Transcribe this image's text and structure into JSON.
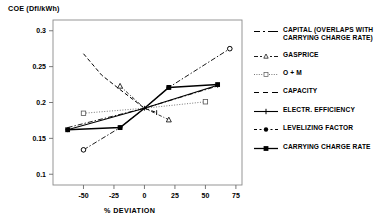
{
  "chart_data": {
    "type": "line",
    "title": "",
    "ylabel": "COE (Dfl/kWh)",
    "xlabel": "% DEVIATION",
    "xlim": [
      -75,
      80
    ],
    "ylim": [
      0.085,
      0.315
    ],
    "xticks": [
      -50,
      -25,
      0,
      25,
      50,
      75
    ],
    "xticklabels": [
      "-50",
      "-25",
      "0",
      "25",
      "50",
      "75"
    ],
    "yticks": [
      0.1,
      0.15,
      0.2,
      0.25,
      0.3
    ],
    "yticklabels": [
      "0.1",
      "0.15",
      "0.2",
      "0.25",
      "0.3"
    ],
    "grid": false,
    "legend_position": "right",
    "base_point": {
      "x": 0,
      "y": 0.192
    },
    "series": [
      {
        "name": "CAPITAL (OVERLAPS WITH CARRYING CHARGE RATE)",
        "legend_label": "CAPITAL (OVERLAPS WITH\nCARRYING CHARGE RATE)",
        "style": "dash-dot",
        "marker": "none",
        "color": "#000000",
        "x": [
          -63,
          0,
          60
        ],
        "y": [
          0.165,
          0.192,
          0.223
        ]
      },
      {
        "name": "GASPRICE",
        "legend_label": "GASPRICE",
        "style": "dash-dot-fine",
        "marker": "triangle-open",
        "color": "#000000",
        "x": [
          -20,
          0,
          20
        ],
        "y": [
          0.223,
          0.192,
          0.176
        ]
      },
      {
        "name": "O + M",
        "legend_label": "O + M",
        "style": "dotted",
        "marker": "square-open",
        "color": "#000000",
        "x": [
          -50,
          0,
          50
        ],
        "y": [
          0.185,
          0.192,
          0.201
        ]
      },
      {
        "name": "CAPACITY",
        "legend_label": "CAPACITY",
        "style": "dashed",
        "marker": "tick",
        "color": "#000000",
        "x": [
          -50,
          -35,
          -20,
          0,
          10
        ],
        "y": [
          0.268,
          0.238,
          0.218,
          0.192,
          0.186
        ]
      },
      {
        "name": "ELECTR. EFFICIENCY",
        "legend_label": "ELECTR. EFFICIENCY",
        "style": "solid",
        "marker": "plus",
        "color": "#000000",
        "x": [
          -63,
          0,
          60
        ],
        "y": [
          0.162,
          0.192,
          0.224
        ]
      },
      {
        "name": "LEVELIZING FACTOR",
        "legend_label": "LEVELIZING FACTOR",
        "style": "dash-dot",
        "marker": "circle-filled",
        "color": "#000000",
        "x": [
          -50,
          -20,
          0,
          20,
          70
        ],
        "y": [
          0.134,
          0.165,
          0.192,
          0.221,
          0.275
        ]
      },
      {
        "name": "CARRYING CHARGE RATE",
        "legend_label": "CARRYING CHARGE RATE",
        "style": "solid-thick",
        "marker": "square-filled",
        "color": "#000000",
        "x": [
          -63,
          -20,
          0,
          20,
          60
        ],
        "y": [
          0.162,
          0.165,
          0.192,
          0.221,
          0.225
        ]
      }
    ]
  }
}
